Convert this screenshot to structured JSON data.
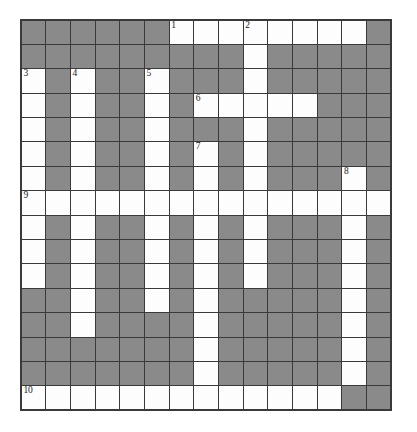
{
  "puzzle": {
    "title": "Crossword Puzzle Grid",
    "rows": 16,
    "cols": 15,
    "colors": {
      "block": "#8a8a8a",
      "open": "#fdfdfd",
      "gridline": "#3a3a3a",
      "number": "#1a1a1a",
      "page_background": "#ffffff"
    },
    "legend": {
      "block_label": "blocked-cell",
      "open_label": "open-cell"
    },
    "clue_numbers": [
      {
        "number": "1",
        "row": 1,
        "col": 7
      },
      {
        "number": "2",
        "row": 1,
        "col": 10
      },
      {
        "number": "3",
        "row": 3,
        "col": 1
      },
      {
        "number": "4",
        "row": 3,
        "col": 3
      },
      {
        "number": "5",
        "row": 3,
        "col": 6
      },
      {
        "number": "6",
        "row": 4,
        "col": 8
      },
      {
        "number": "7",
        "row": 6,
        "col": 8
      },
      {
        "number": "8",
        "row": 7,
        "col": 14
      },
      {
        "number": "9",
        "row": 8,
        "col": 1
      },
      {
        "number": "10",
        "row": 16,
        "col": 1
      }
    ],
    "grid": [
      [
        "block",
        "block",
        "block",
        "block",
        "block",
        "block",
        "open",
        "open",
        "open",
        "open",
        "open",
        "open",
        "open",
        "open",
        "block"
      ],
      [
        "block",
        "block",
        "block",
        "block",
        "block",
        "block",
        "block",
        "block",
        "block",
        "open",
        "block",
        "block",
        "block",
        "block",
        "block"
      ],
      [
        "open",
        "block",
        "open",
        "block",
        "block",
        "open",
        "block",
        "block",
        "block",
        "open",
        "block",
        "block",
        "block",
        "block",
        "block"
      ],
      [
        "open",
        "block",
        "open",
        "block",
        "block",
        "open",
        "block",
        "open",
        "open",
        "open",
        "open",
        "open",
        "block",
        "block",
        "block"
      ],
      [
        "open",
        "block",
        "open",
        "block",
        "block",
        "open",
        "block",
        "block",
        "block",
        "open",
        "block",
        "block",
        "block",
        "block",
        "block"
      ],
      [
        "open",
        "block",
        "open",
        "block",
        "block",
        "open",
        "block",
        "open",
        "block",
        "open",
        "block",
        "block",
        "block",
        "block",
        "block"
      ],
      [
        "open",
        "block",
        "open",
        "block",
        "block",
        "open",
        "block",
        "open",
        "block",
        "open",
        "block",
        "block",
        "block",
        "open",
        "block"
      ],
      [
        "open",
        "open",
        "open",
        "open",
        "open",
        "open",
        "open",
        "open",
        "open",
        "open",
        "open",
        "open",
        "open",
        "open",
        "open"
      ],
      [
        "open",
        "block",
        "open",
        "block",
        "block",
        "open",
        "block",
        "open",
        "block",
        "open",
        "block",
        "block",
        "block",
        "open",
        "block"
      ],
      [
        "open",
        "block",
        "open",
        "block",
        "block",
        "open",
        "block",
        "open",
        "block",
        "open",
        "block",
        "block",
        "block",
        "open",
        "block"
      ],
      [
        "open",
        "block",
        "open",
        "block",
        "block",
        "open",
        "block",
        "open",
        "block",
        "open",
        "block",
        "block",
        "block",
        "open",
        "block"
      ],
      [
        "block",
        "block",
        "open",
        "block",
        "block",
        "open",
        "block",
        "open",
        "block",
        "block",
        "block",
        "block",
        "block",
        "open",
        "block"
      ],
      [
        "block",
        "block",
        "open",
        "block",
        "block",
        "block",
        "block",
        "open",
        "block",
        "block",
        "block",
        "block",
        "block",
        "open",
        "block"
      ],
      [
        "block",
        "block",
        "block",
        "block",
        "block",
        "block",
        "block",
        "open",
        "block",
        "block",
        "block",
        "block",
        "block",
        "open",
        "block"
      ],
      [
        "block",
        "block",
        "block",
        "block",
        "block",
        "block",
        "block",
        "open",
        "block",
        "block",
        "block",
        "block",
        "block",
        "open",
        "block"
      ],
      [
        "open",
        "open",
        "open",
        "open",
        "open",
        "open",
        "open",
        "open",
        "open",
        "open",
        "open",
        "open",
        "open",
        "block",
        "block"
      ]
    ]
  }
}
